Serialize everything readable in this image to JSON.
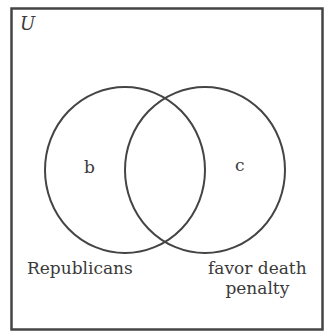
{
  "diagram": {
    "type": "venn",
    "universe_label": "U",
    "sets": [
      {
        "name": "Republicans",
        "region_label": "b"
      },
      {
        "name": "favor death penalty",
        "name_lines": [
          "favor death",
          "penalty"
        ],
        "region_label": "c"
      }
    ],
    "intersection_label": "",
    "colors": {
      "stroke": "#444444",
      "background": "#ffffff",
      "text": "#3a3a3a"
    }
  }
}
